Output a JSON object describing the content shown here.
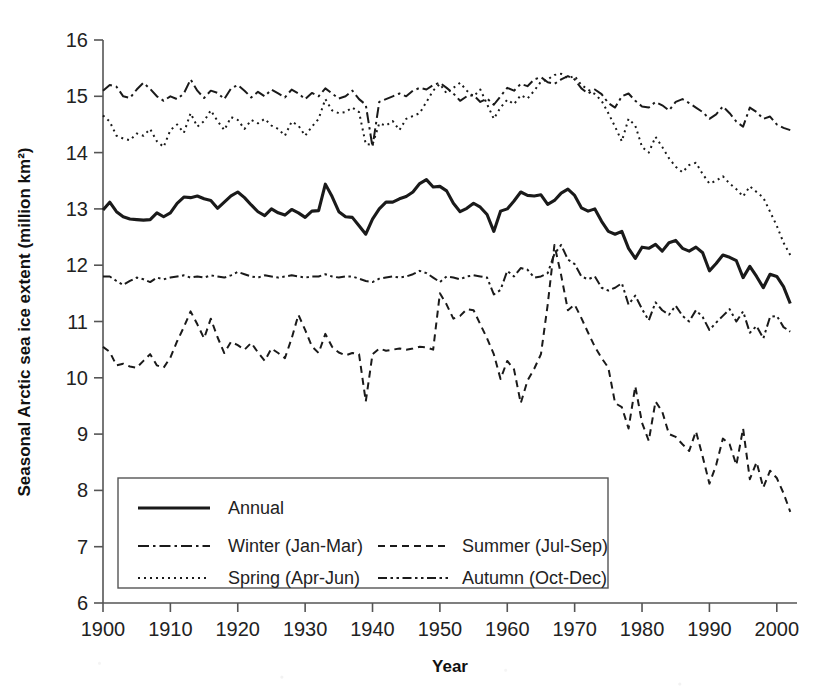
{
  "chart_data": {
    "type": "line",
    "title": "",
    "xlabel": "Year",
    "ylabel": "Seasonal Arctic sea ice extent (million km²)",
    "xlim": [
      1900,
      2003
    ],
    "ylim": [
      6,
      16
    ],
    "grid": false,
    "legend_position": "bottom-left-inside",
    "xticks": [
      1900,
      1910,
      1920,
      1930,
      1940,
      1950,
      1960,
      1970,
      1980,
      1990,
      2000
    ],
    "xtick_labels": [
      "1900",
      "1910",
      "1920",
      "1930",
      "1940",
      "1950",
      "1960",
      "1970",
      "1980",
      "1990",
      "2000"
    ],
    "yticks": [
      6,
      7,
      8,
      9,
      10,
      11,
      12,
      13,
      14,
      15,
      16
    ],
    "ytick_labels": [
      "6",
      "7",
      "8",
      "9",
      "10",
      "11",
      "12",
      "13",
      "14",
      "15",
      "16"
    ],
    "x": [
      1900,
      1901,
      1902,
      1903,
      1904,
      1905,
      1906,
      1907,
      1908,
      1909,
      1910,
      1911,
      1912,
      1913,
      1914,
      1915,
      1916,
      1917,
      1918,
      1919,
      1920,
      1921,
      1922,
      1923,
      1924,
      1925,
      1926,
      1927,
      1928,
      1929,
      1930,
      1931,
      1932,
      1933,
      1934,
      1935,
      1936,
      1937,
      1938,
      1939,
      1940,
      1941,
      1942,
      1943,
      1944,
      1945,
      1946,
      1947,
      1948,
      1949,
      1950,
      1951,
      1952,
      1953,
      1954,
      1955,
      1956,
      1957,
      1958,
      1959,
      1960,
      1961,
      1962,
      1963,
      1964,
      1965,
      1966,
      1967,
      1968,
      1969,
      1970,
      1971,
      1972,
      1973,
      1974,
      1975,
      1976,
      1977,
      1978,
      1979,
      1980,
      1981,
      1982,
      1983,
      1984,
      1985,
      1986,
      1987,
      1988,
      1989,
      1990,
      1991,
      1992,
      1993,
      1994,
      1995,
      1996,
      1997,
      1998,
      1999,
      2000,
      2001,
      2002
    ],
    "series": [
      {
        "name": "Annual",
        "style": "solid",
        "values": [
          12.98,
          13.12,
          12.95,
          12.86,
          12.82,
          12.81,
          12.8,
          12.81,
          12.93,
          12.86,
          12.93,
          13.1,
          13.21,
          13.2,
          13.23,
          13.18,
          13.15,
          13.01,
          13.12,
          13.23,
          13.3,
          13.2,
          13.07,
          12.95,
          12.88,
          13.0,
          12.93,
          12.89,
          12.99,
          12.93,
          12.85,
          12.96,
          12.97,
          13.44,
          13.22,
          12.95,
          12.86,
          12.85,
          12.7,
          12.55,
          12.82,
          13.0,
          13.12,
          13.12,
          13.18,
          13.22,
          13.3,
          13.45,
          13.52,
          13.39,
          13.4,
          13.32,
          13.1,
          12.95,
          13.01,
          13.1,
          13.03,
          12.9,
          12.6,
          12.96,
          13.0,
          13.14,
          13.3,
          13.24,
          13.23,
          13.25,
          13.08,
          13.15,
          13.28,
          13.35,
          13.24,
          13.02,
          12.96,
          13.0,
          12.78,
          12.6,
          12.55,
          12.6,
          12.3,
          12.12,
          12.32,
          12.3,
          12.37,
          12.25,
          12.4,
          12.44,
          12.3,
          12.25,
          12.32,
          12.22,
          11.9,
          12.03,
          12.18,
          12.14,
          12.08,
          11.78,
          11.98,
          11.8,
          11.6,
          11.84,
          11.8,
          11.62,
          11.32
        ]
      },
      {
        "name": "Winter (Jan-Mar)",
        "style": "dashdot",
        "values": [
          15.1,
          15.2,
          15.17,
          15.0,
          14.97,
          15.12,
          15.24,
          15.13,
          15.0,
          14.92,
          15.0,
          14.95,
          15.05,
          15.3,
          15.1,
          14.97,
          15.1,
          15.06,
          14.95,
          15.14,
          15.2,
          15.1,
          14.98,
          15.08,
          15.0,
          15.12,
          15.05,
          14.98,
          15.12,
          15.05,
          14.95,
          15.06,
          15.0,
          15.14,
          15.05,
          14.96,
          15.0,
          15.1,
          14.95,
          14.85,
          14.1,
          14.9,
          14.95,
          15.0,
          15.05,
          15.0,
          15.1,
          15.15,
          15.12,
          15.2,
          15.24,
          15.15,
          15.05,
          14.92,
          15.0,
          15.02,
          14.9,
          14.96,
          14.85,
          15.0,
          15.15,
          15.1,
          15.22,
          15.18,
          15.3,
          15.34,
          15.25,
          15.22,
          15.3,
          15.36,
          15.3,
          15.14,
          15.05,
          15.12,
          15.04,
          14.88,
          14.8,
          15.0,
          15.05,
          14.92,
          14.82,
          14.8,
          14.9,
          14.84,
          14.75,
          14.9,
          14.95,
          14.88,
          14.8,
          14.72,
          14.6,
          14.68,
          14.82,
          14.7,
          14.55,
          14.46,
          14.8,
          14.72,
          14.6,
          14.64,
          14.5,
          14.44,
          14.4
        ]
      },
      {
        "name": "Spring (Apr-Jun)",
        "style": "dotted",
        "values": [
          14.66,
          14.55,
          14.3,
          14.25,
          14.22,
          14.34,
          14.3,
          14.42,
          14.2,
          14.1,
          14.4,
          14.5,
          14.35,
          14.7,
          14.46,
          14.56,
          14.75,
          14.56,
          14.4,
          14.63,
          14.58,
          14.42,
          14.58,
          14.52,
          14.6,
          14.48,
          14.42,
          14.3,
          14.55,
          14.48,
          14.3,
          14.46,
          14.6,
          14.95,
          14.75,
          14.7,
          14.72,
          14.8,
          14.72,
          14.15,
          14.14,
          14.52,
          14.48,
          14.56,
          14.4,
          14.6,
          14.65,
          14.7,
          14.9,
          15.1,
          15.22,
          15.05,
          15.15,
          15.24,
          15.1,
          15.0,
          15.12,
          14.86,
          14.6,
          14.8,
          14.94,
          14.86,
          15.02,
          14.96,
          15.1,
          15.26,
          15.3,
          15.38,
          15.4,
          15.32,
          15.36,
          15.2,
          15.12,
          15.04,
          14.92,
          14.7,
          14.46,
          14.2,
          14.6,
          14.48,
          14.1,
          14.0,
          14.28,
          14.1,
          13.9,
          13.75,
          13.65,
          13.78,
          13.82,
          13.62,
          13.45,
          13.5,
          13.58,
          13.45,
          13.35,
          13.22,
          13.4,
          13.3,
          13.2,
          12.95,
          12.7,
          12.4,
          12.18
        ]
      },
      {
        "name": "Summer (Jul-Sep)",
        "style": "dashed",
        "values": [
          10.55,
          10.46,
          10.22,
          10.25,
          10.2,
          10.18,
          10.3,
          10.42,
          10.22,
          10.18,
          10.36,
          10.65,
          10.9,
          11.18,
          10.95,
          10.7,
          11.05,
          10.72,
          10.44,
          10.64,
          10.58,
          10.5,
          10.62,
          10.45,
          10.3,
          10.52,
          10.44,
          10.35,
          10.7,
          11.12,
          10.85,
          10.56,
          10.44,
          10.78,
          10.55,
          10.45,
          10.4,
          10.44,
          10.42,
          9.58,
          10.42,
          10.52,
          10.48,
          10.5,
          10.52,
          10.5,
          10.52,
          10.55,
          10.54,
          10.5,
          11.5,
          11.3,
          11.05,
          11.1,
          11.22,
          11.2,
          10.95,
          10.7,
          10.42,
          9.98,
          10.3,
          10.15,
          9.55,
          9.95,
          10.16,
          10.42,
          11.3,
          12.36,
          11.82,
          11.2,
          11.3,
          11.06,
          10.8,
          10.55,
          10.35,
          10.18,
          9.55,
          9.48,
          9.1,
          9.85,
          9.2,
          8.88,
          9.58,
          9.4,
          9.0,
          8.95,
          8.82,
          8.7,
          9.05,
          8.6,
          8.12,
          8.45,
          8.92,
          8.82,
          8.45,
          9.1,
          8.2,
          8.5,
          8.05,
          8.35,
          8.22,
          7.95,
          7.62
        ]
      },
      {
        "name": "Autumn (Oct-Dec)",
        "style": "dashdotdot",
        "values": [
          11.8,
          11.8,
          11.72,
          11.65,
          11.72,
          11.78,
          11.75,
          11.7,
          11.78,
          11.75,
          11.78,
          11.8,
          11.82,
          11.78,
          11.8,
          11.78,
          11.82,
          11.8,
          11.78,
          11.82,
          11.88,
          11.84,
          11.8,
          11.78,
          11.82,
          11.8,
          11.78,
          11.8,
          11.82,
          11.8,
          11.78,
          11.8,
          11.8,
          11.84,
          11.8,
          11.78,
          11.8,
          11.8,
          11.76,
          11.72,
          11.7,
          11.76,
          11.78,
          11.8,
          11.78,
          11.8,
          11.84,
          11.9,
          11.86,
          11.78,
          11.7,
          11.8,
          11.78,
          11.75,
          11.8,
          11.82,
          11.8,
          11.78,
          11.48,
          11.56,
          11.9,
          11.8,
          11.95,
          11.92,
          11.78,
          11.8,
          11.86,
          12.2,
          12.36,
          12.1,
          12.02,
          11.8,
          11.75,
          11.8,
          11.6,
          11.55,
          11.6,
          11.68,
          11.3,
          11.46,
          11.22,
          11.02,
          11.34,
          11.2,
          11.12,
          11.28,
          11.1,
          11.0,
          11.2,
          11.08,
          10.85,
          10.98,
          11.1,
          11.22,
          11.0,
          11.18,
          10.8,
          10.92,
          10.7,
          11.08,
          11.1,
          10.9,
          10.82
        ]
      }
    ]
  },
  "legend": {
    "entries": [
      {
        "label": "Annual",
        "style": "solid"
      },
      {
        "label": "Winter (Jan-Mar)",
        "style": "dashdot"
      },
      {
        "label": "Summer (Jul-Sep)",
        "style": "dashed"
      },
      {
        "label": "Spring (Apr-Jun)",
        "style": "dotted"
      },
      {
        "label": "Autumn (Oct-Dec)",
        "style": "dashdotdot"
      }
    ]
  },
  "colors": {
    "ink": "#1a1a1a",
    "axis": "#555555",
    "background": "#ffffff"
  }
}
